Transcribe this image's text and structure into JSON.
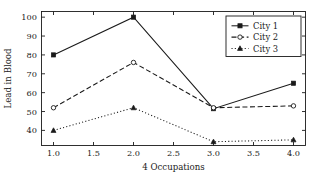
{
  "chart_data": {
    "type": "line",
    "title": "",
    "xlabel": "4 Occupations",
    "ylabel": "Lead in Blood",
    "x": [
      1.0,
      2.0,
      3.0,
      4.0
    ],
    "xlim": [
      0.85,
      4.15
    ],
    "ylim": [
      32.0,
      103.0
    ],
    "xticks": [
      "1.0",
      "1.5",
      "2.0",
      "2.5",
      "3.0",
      "3.5",
      "4.0"
    ],
    "xtickvalues": [
      1.0,
      1.5,
      2.0,
      2.5,
      3.0,
      3.5,
      4.0
    ],
    "yticks": [
      "40",
      "50",
      "60",
      "70",
      "80",
      "90",
      "100"
    ],
    "ytickvalues": [
      40,
      50,
      60,
      70,
      80,
      90,
      100
    ],
    "grid": false,
    "legend_position": "upper right",
    "series": [
      {
        "name": "City 1",
        "values": [
          80,
          100,
          51.5,
          65
        ],
        "linestyle": "solid",
        "marker": "filled-square",
        "color": "#1a1a1a"
      },
      {
        "name": "City 2",
        "values": [
          52,
          76,
          52,
          53
        ],
        "linestyle": "dashed",
        "marker": "open-circle",
        "color": "#1a1a1a"
      },
      {
        "name": "City 3",
        "values": [
          40,
          52,
          34,
          35
        ],
        "linestyle": "dotted",
        "marker": "filled-triangle",
        "color": "#1a1a1a"
      }
    ]
  },
  "axes": {
    "xlabel": "4 Occupations",
    "ylabel": "Lead in Blood",
    "xticks": [
      "1.0",
      "1.5",
      "2.0",
      "2.5",
      "3.0",
      "3.5",
      "4.0"
    ],
    "yticks": [
      "40",
      "50",
      "60",
      "70",
      "80",
      "90",
      "100"
    ]
  },
  "legend": {
    "entries": [
      {
        "label": "City 1"
      },
      {
        "label": "City 2"
      },
      {
        "label": "City 3"
      }
    ]
  },
  "style": {
    "foreground": "#1a1a1a",
    "background": "#ffffff",
    "frame": "#1a1a1a"
  }
}
